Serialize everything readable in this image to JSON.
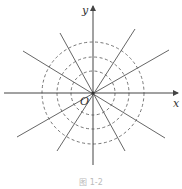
{
  "diagram": {
    "type": "direction-field-figure",
    "labels": {
      "x_axis": "x",
      "y_axis": "y",
      "origin": "O"
    },
    "caption": "图 1-2",
    "center": [
      93,
      93
    ],
    "circle_radii": [
      22,
      36,
      51
    ],
    "line_angles_deg": [
      60,
      -60,
      27,
      -27
    ],
    "colors": {
      "stroke": "#555555",
      "background": "#ffffff"
    }
  }
}
